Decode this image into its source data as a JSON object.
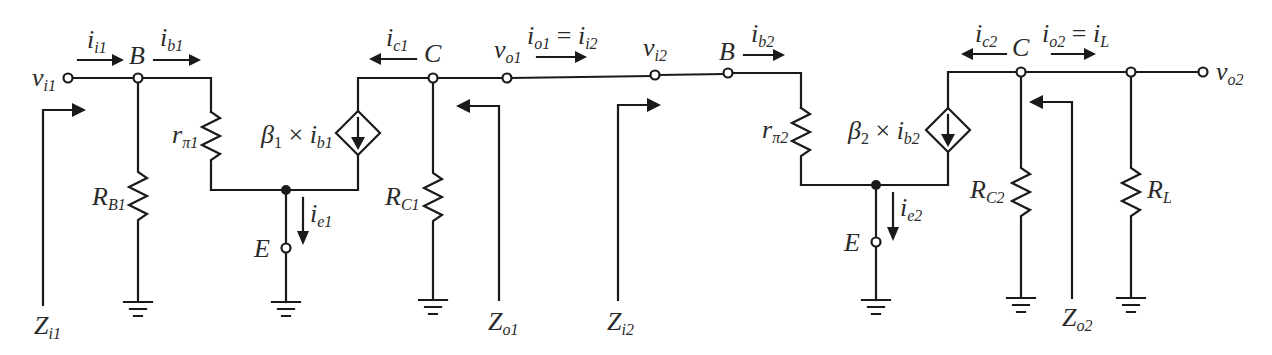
{
  "diagram": {
    "stage1": {
      "input_voltage": {
        "base": "v",
        "sub": "i1"
      },
      "input_current": {
        "base": "i",
        "sub": "i1"
      },
      "base_node": "B",
      "base_current": {
        "base": "i",
        "sub": "b1"
      },
      "rpi": {
        "base": "r",
        "sub": "π1"
      },
      "rb": {
        "base": "R",
        "sub": "B1"
      },
      "source": {
        "beta": "β",
        "beta_sub": "1",
        "times": " × ",
        "i": "i",
        "i_sub": "b1"
      },
      "collector_node": "C",
      "collector_current": {
        "base": "i",
        "sub": "c1"
      },
      "rc": {
        "base": "R",
        "sub": "C1"
      },
      "emitter_node": "E",
      "emitter_current": {
        "base": "i",
        "sub": "e1"
      },
      "output_voltage": {
        "base": "v",
        "sub": "o1"
      },
      "output_current": {
        "lhs": "i",
        "lhs_sub": "o1",
        "eq": " = ",
        "rhs": "i",
        "rhs_sub": "i2"
      },
      "zin": {
        "base": "Z",
        "sub": "i1"
      },
      "zout": {
        "base": "Z",
        "sub": "o1"
      }
    },
    "stage2": {
      "input_voltage": {
        "base": "v",
        "sub": "i2"
      },
      "base_node": "B",
      "base_current": {
        "base": "i",
        "sub": "b2"
      },
      "rpi": {
        "base": "r",
        "sub": "π2"
      },
      "source": {
        "beta": "β",
        "beta_sub": "2",
        "times": " × ",
        "i": "i",
        "i_sub": "b2"
      },
      "collector_node": "C",
      "collector_current": {
        "base": "i",
        "sub": "c2"
      },
      "rc": {
        "base": "R",
        "sub": "C2"
      },
      "emitter_node": "E",
      "emitter_current": {
        "base": "i",
        "sub": "e2"
      },
      "output_current": {
        "lhs": "i",
        "lhs_sub": "o2",
        "eq": " = ",
        "rhs": "i",
        "rhs_sub": "L"
      },
      "rl": {
        "base": "R",
        "sub": "L"
      },
      "output_voltage": {
        "base": "v",
        "sub": "o2"
      },
      "zin": {
        "base": "Z",
        "sub": "i2"
      },
      "zout": {
        "base": "Z",
        "sub": "o2"
      }
    }
  }
}
